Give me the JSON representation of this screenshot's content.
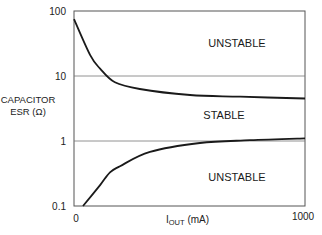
{
  "chart_data": {
    "type": "line",
    "title": "",
    "xlabel": "IOUT (mA)",
    "xlabel_main": "I",
    "xlabel_sub": "OUT",
    "xlabel_unit": " (mA)",
    "ylabel_line1": "CAPACITOR",
    "ylabel_line2": "ESR (Ω)",
    "yscale": "log",
    "xlim": [
      0,
      1000
    ],
    "ylim": [
      0.1,
      100
    ],
    "x_ticks": [
      "0",
      "1000"
    ],
    "y_ticks": [
      "100",
      "10",
      "1",
      "0.1"
    ],
    "gridlines_y": [
      10,
      1
    ],
    "legend": null,
    "regions": [
      {
        "label": "UNSTABLE",
        "position": "upper"
      },
      {
        "label": "STABLE",
        "position": "middle"
      },
      {
        "label": "UNSTABLE",
        "position": "lower"
      }
    ],
    "series": [
      {
        "name": "Upper ESR boundary",
        "x": [
          0,
          70,
          113,
          177,
          285,
          502,
          719,
          1000
        ],
        "y": [
          75,
          21,
          13,
          8,
          6.3,
          5.1,
          4.8,
          4.5
        ]
      },
      {
        "name": "Lower ESR boundary",
        "x": [
          39,
          113,
          156,
          199,
          329,
          545,
          762,
          1000
        ],
        "y": [
          0.1,
          0.21,
          0.33,
          0.41,
          0.68,
          0.93,
          1.03,
          1.1
        ]
      }
    ]
  }
}
